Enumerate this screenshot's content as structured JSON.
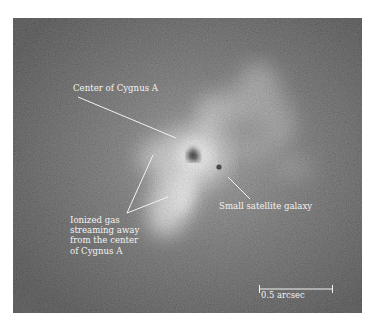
{
  "figure": {
    "annotations": {
      "center": "Center of Cygnus A",
      "satellite": "Small satellite galaxy",
      "ionized_gas": [
        "Ionized gas",
        "streaming away",
        "from the center",
        "of Cygnus A"
      ]
    },
    "scale_bar": {
      "label": "0.5 arcsec"
    },
    "colors": {
      "background": "#3a3a3a",
      "glow": "#e6e6e6",
      "core": "#0a0a0a",
      "annotation": "#f2f2f2"
    }
  }
}
